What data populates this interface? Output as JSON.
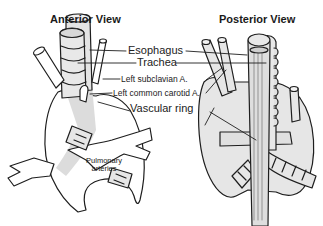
{
  "figure": {
    "views": [
      {
        "id": "anterior",
        "title": "Anterior View"
      },
      {
        "id": "posterior",
        "title": "Posterior View"
      }
    ],
    "labels": {
      "esophagus": "Esophagus",
      "trachea": "Trachea",
      "left_subclavian": "Left subclavian A.",
      "left_common_carotid": "Left common carotid A.",
      "vascular_ring": "Vascular ring",
      "pulmonary_line1": "Pulmonary",
      "pulmonary_line2": "arteries"
    },
    "colors": {
      "line": "#1e1e1e",
      "fill": "#e6e6e6",
      "highlight": "#d9d9d9",
      "background": "#ffffff"
    }
  }
}
